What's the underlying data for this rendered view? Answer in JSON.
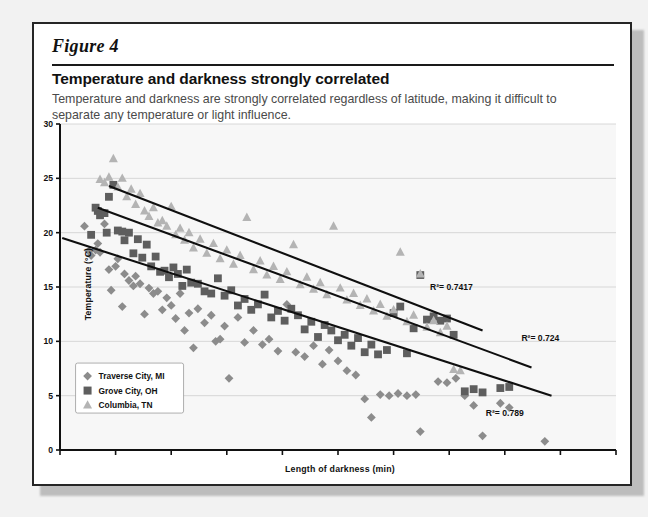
{
  "figure": {
    "label": "Figure 4",
    "headline": "Temperature and darkness strongly correlated",
    "subhead": "Temperature and darkness are strongly correlated regardless of latitude, making it difficult to separate any temperature or light influence."
  },
  "chart_data": {
    "type": "scatter",
    "title": "Temperature and darkness strongly correlated",
    "xlabel": "Length of darkness (min)",
    "ylabel": "Temperature (°C)",
    "xlim": [
      650,
      900
    ],
    "ylim": [
      0,
      30
    ],
    "xticks": [
      "650",
      "675",
      "700",
      "725",
      "750",
      "775",
      "800",
      "825",
      "850",
      "875",
      "900"
    ],
    "yticks": [
      "0",
      "5",
      "10",
      "15",
      "20",
      "25",
      "30"
    ],
    "grid": "horizontal",
    "legend_position": "lower-left-inside",
    "series": [
      {
        "name": "Traverse City, MI",
        "marker": "diamond",
        "color": "#8c8c8c",
        "points": [
          [
            661,
            20.6
          ],
          [
            663,
            18.3
          ],
          [
            664,
            17.9
          ],
          [
            666,
            18.4
          ],
          [
            667,
            19.0
          ],
          [
            668,
            18.2
          ],
          [
            670,
            20.8
          ],
          [
            672,
            16.6
          ],
          [
            673,
            14.7
          ],
          [
            675,
            16.9
          ],
          [
            676,
            17.6
          ],
          [
            678,
            13.2
          ],
          [
            679,
            16.2
          ],
          [
            681,
            15.6
          ],
          [
            683,
            15.1
          ],
          [
            684,
            16.0
          ],
          [
            686,
            15.3
          ],
          [
            688,
            12.5
          ],
          [
            690,
            14.9
          ],
          [
            692,
            14.4
          ],
          [
            694,
            14.6
          ],
          [
            696,
            12.9
          ],
          [
            698,
            14.0
          ],
          [
            700,
            13.3
          ],
          [
            702,
            12.1
          ],
          [
            704,
            14.4
          ],
          [
            706,
            11.0
          ],
          [
            708,
            12.6
          ],
          [
            710,
            9.4
          ],
          [
            712,
            13.0
          ],
          [
            715,
            11.7
          ],
          [
            718,
            12.4
          ],
          [
            720,
            10.0
          ],
          [
            722,
            10.2
          ],
          [
            724,
            11.4
          ],
          [
            726,
            6.6
          ],
          [
            730,
            12.2
          ],
          [
            733,
            9.9
          ],
          [
            737,
            11.0
          ],
          [
            741,
            9.7
          ],
          [
            744,
            10.2
          ],
          [
            748,
            9.1
          ],
          [
            752,
            13.4
          ],
          [
            756,
            9.0
          ],
          [
            760,
            8.6
          ],
          [
            764,
            9.6
          ],
          [
            768,
            7.9
          ],
          [
            771,
            9.2
          ],
          [
            775,
            8.2
          ],
          [
            779,
            7.3
          ],
          [
            783,
            6.9
          ],
          [
            787,
            4.7
          ],
          [
            790,
            3.0
          ],
          [
            794,
            5.1
          ],
          [
            798,
            5.0
          ],
          [
            802,
            5.2
          ],
          [
            806,
            5.0
          ],
          [
            810,
            5.1
          ],
          [
            812,
            1.7
          ],
          [
            820,
            6.3
          ],
          [
            824,
            6.2
          ],
          [
            828,
            6.6
          ],
          [
            832,
            5.0
          ],
          [
            836,
            4.1
          ],
          [
            840,
            1.3
          ],
          [
            848,
            4.3
          ],
          [
            852,
            3.9
          ],
          [
            868,
            0.8
          ]
        ]
      },
      {
        "name": "Grove City, OH",
        "marker": "square",
        "color": "#5e5e5e",
        "points": [
          [
            664,
            19.8
          ],
          [
            666,
            22.3
          ],
          [
            667,
            22.0
          ],
          [
            668,
            21.6
          ],
          [
            670,
            21.8
          ],
          [
            671,
            20.0
          ],
          [
            672,
            23.3
          ],
          [
            674,
            24.4
          ],
          [
            676,
            20.2
          ],
          [
            678,
            20.1
          ],
          [
            679,
            19.3
          ],
          [
            681,
            20.0
          ],
          [
            683,
            18.1
          ],
          [
            685,
            19.4
          ],
          [
            687,
            17.7
          ],
          [
            689,
            18.9
          ],
          [
            691,
            16.9
          ],
          [
            693,
            17.8
          ],
          [
            695,
            16.4
          ],
          [
            697,
            16.5
          ],
          [
            699,
            15.9
          ],
          [
            701,
            16.8
          ],
          [
            703,
            16.2
          ],
          [
            705,
            15.1
          ],
          [
            707,
            16.6
          ],
          [
            709,
            15.4
          ],
          [
            712,
            15.3
          ],
          [
            715,
            14.6
          ],
          [
            718,
            14.4
          ],
          [
            721,
            15.8
          ],
          [
            724,
            14.2
          ],
          [
            727,
            14.7
          ],
          [
            730,
            13.3
          ],
          [
            733,
            13.9
          ],
          [
            736,
            12.9
          ],
          [
            739,
            13.4
          ],
          [
            742,
            14.3
          ],
          [
            745,
            12.2
          ],
          [
            748,
            12.8
          ],
          [
            751,
            11.9
          ],
          [
            754,
            13.0
          ],
          [
            757,
            12.4
          ],
          [
            760,
            11.1
          ],
          [
            763,
            11.8
          ],
          [
            766,
            10.4
          ],
          [
            769,
            11.5
          ],
          [
            772,
            11.0
          ],
          [
            775,
            10.1
          ],
          [
            778,
            10.6
          ],
          [
            781,
            9.6
          ],
          [
            784,
            10.3
          ],
          [
            787,
            9.0
          ],
          [
            790,
            9.7
          ],
          [
            793,
            8.8
          ],
          [
            797,
            9.2
          ],
          [
            800,
            12.6
          ],
          [
            803,
            13.2
          ],
          [
            806,
            8.9
          ],
          [
            809,
            11.2
          ],
          [
            812,
            16.1
          ],
          [
            815,
            12.0
          ],
          [
            818,
            12.3
          ],
          [
            821,
            11.9
          ],
          [
            824,
            12.1
          ],
          [
            827,
            10.6
          ],
          [
            832,
            5.4
          ],
          [
            836,
            5.6
          ],
          [
            840,
            5.3
          ],
          [
            848,
            5.7
          ],
          [
            852,
            5.8
          ]
        ]
      },
      {
        "name": "Columbia, TN",
        "marker": "triangle",
        "color": "#b4b4b4",
        "points": [
          [
            668,
            24.9
          ],
          [
            670,
            24.6
          ],
          [
            672,
            25.1
          ],
          [
            674,
            26.8
          ],
          [
            676,
            24.2
          ],
          [
            678,
            25.0
          ],
          [
            680,
            23.3
          ],
          [
            682,
            24.0
          ],
          [
            684,
            22.6
          ],
          [
            686,
            23.6
          ],
          [
            688,
            22.0
          ],
          [
            690,
            21.5
          ],
          [
            692,
            22.3
          ],
          [
            694,
            20.9
          ],
          [
            696,
            21.1
          ],
          [
            698,
            20.6
          ],
          [
            700,
            22.4
          ],
          [
            702,
            19.8
          ],
          [
            704,
            20.4
          ],
          [
            706,
            19.3
          ],
          [
            708,
            20.0
          ],
          [
            710,
            18.6
          ],
          [
            713,
            19.4
          ],
          [
            716,
            18.1
          ],
          [
            719,
            19.0
          ],
          [
            722,
            17.6
          ],
          [
            725,
            18.4
          ],
          [
            728,
            17.1
          ],
          [
            731,
            17.9
          ],
          [
            734,
            21.4
          ],
          [
            737,
            16.6
          ],
          [
            740,
            17.4
          ],
          [
            743,
            16.1
          ],
          [
            746,
            16.9
          ],
          [
            749,
            15.7
          ],
          [
            752,
            16.4
          ],
          [
            755,
            18.9
          ],
          [
            758,
            15.2
          ],
          [
            761,
            15.9
          ],
          [
            764,
            14.8
          ],
          [
            767,
            15.4
          ],
          [
            770,
            14.3
          ],
          [
            773,
            20.6
          ],
          [
            776,
            14.9
          ],
          [
            779,
            13.8
          ],
          [
            782,
            14.4
          ],
          [
            785,
            13.3
          ],
          [
            788,
            13.9
          ],
          [
            791,
            12.8
          ],
          [
            794,
            13.4
          ],
          [
            797,
            12.3
          ],
          [
            800,
            12.9
          ],
          [
            803,
            18.2
          ],
          [
            806,
            11.8
          ],
          [
            809,
            12.4
          ],
          [
            812,
            16.2
          ],
          [
            815,
            11.3
          ],
          [
            818,
            11.9
          ],
          [
            821,
            10.8
          ],
          [
            824,
            11.4
          ],
          [
            827,
            7.4
          ],
          [
            830,
            7.3
          ]
        ]
      }
    ],
    "trendlines": [
      {
        "label": "R²= 0.7417",
        "x1": 672,
        "y1": 24.3,
        "x2": 840,
        "y2": 11.0
      },
      {
        "label": "R²= 0.724",
        "x1": 667,
        "y1": 22.3,
        "x2": 862,
        "y2": 7.6
      },
      {
        "label": "R²= 0.789",
        "x1": 651,
        "y1": 19.5,
        "x2": 871,
        "y2": 5.0
      }
    ],
    "annotations": [
      {
        "text": "R²= 0.7417",
        "x": 826,
        "y": 14.7
      },
      {
        "text": "R²= 0.724",
        "x": 866,
        "y": 10.0
      },
      {
        "text": "R²= 0.789",
        "x": 850,
        "y": 3.1
      }
    ]
  }
}
